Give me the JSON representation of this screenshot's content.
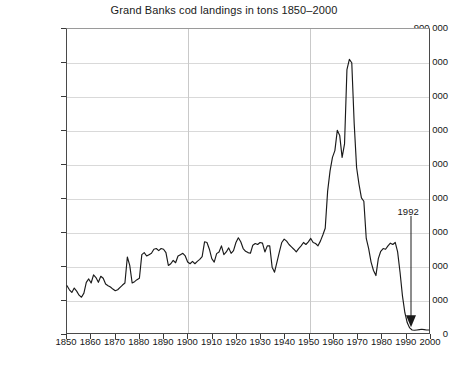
{
  "chart_data": {
    "type": "line",
    "title": "Grand Banks cod landings in tons 1850–2000",
    "xlabel": "",
    "ylabel": "",
    "xlim": [
      1850,
      2000
    ],
    "ylim": [
      0,
      900000
    ],
    "grid": true,
    "legend": "none",
    "y_ticks": [
      0,
      100000,
      200000,
      300000,
      400000,
      500000,
      600000,
      700000,
      800000,
      900000
    ],
    "y_tick_labels": [
      "0",
      "100 000",
      "200 000",
      "300 000",
      "400 000",
      "500 000",
      "600 000",
      "700 000",
      "800 000",
      "900 000"
    ],
    "x_ticks": [
      1850,
      1860,
      1870,
      1880,
      1890,
      1900,
      1910,
      1920,
      1930,
      1940,
      1950,
      1960,
      1970,
      1980,
      1990,
      2000
    ],
    "x_tick_labels": [
      "1850",
      "1860",
      "1870",
      "1880",
      "1890",
      "1900",
      "1910",
      "1920",
      "1930",
      "1940",
      "1950",
      "1960",
      "1970",
      "1980",
      "1990",
      "2000"
    ],
    "x_gridlines": [
      1900,
      1950
    ],
    "series_name": "Grand Banks cod landings",
    "line_color": "#1a1a1a",
    "x": [
      1850,
      1851,
      1852,
      1853,
      1854,
      1855,
      1856,
      1857,
      1858,
      1859,
      1860,
      1861,
      1862,
      1863,
      1864,
      1865,
      1866,
      1867,
      1868,
      1869,
      1870,
      1871,
      1872,
      1873,
      1874,
      1875,
      1876,
      1877,
      1878,
      1879,
      1880,
      1881,
      1882,
      1883,
      1884,
      1885,
      1886,
      1887,
      1888,
      1889,
      1890,
      1891,
      1892,
      1893,
      1894,
      1895,
      1896,
      1897,
      1898,
      1899,
      1900,
      1901,
      1902,
      1903,
      1904,
      1905,
      1906,
      1907,
      1908,
      1909,
      1910,
      1911,
      1912,
      1913,
      1914,
      1915,
      1916,
      1917,
      1918,
      1919,
      1920,
      1921,
      1922,
      1923,
      1924,
      1925,
      1926,
      1927,
      1928,
      1929,
      1930,
      1931,
      1932,
      1933,
      1934,
      1935,
      1936,
      1937,
      1938,
      1939,
      1940,
      1941,
      1942,
      1943,
      1944,
      1945,
      1946,
      1947,
      1948,
      1949,
      1950,
      1951,
      1952,
      1953,
      1954,
      1955,
      1956,
      1957,
      1958,
      1959,
      1960,
      1961,
      1962,
      1963,
      1964,
      1965,
      1966,
      1967,
      1968,
      1969,
      1970,
      1971,
      1972,
      1973,
      1974,
      1975,
      1976,
      1977,
      1978,
      1979,
      1980,
      1981,
      1982,
      1983,
      1984,
      1985,
      1986,
      1987,
      1988,
      1989,
      1990,
      1991,
      1992,
      1993,
      1994,
      1995,
      1996,
      1997,
      1998,
      1999,
      2000
    ],
    "y": [
      140000,
      128000,
      120000,
      133000,
      124000,
      112000,
      106000,
      118000,
      150000,
      160000,
      148000,
      172000,
      164000,
      150000,
      168000,
      162000,
      145000,
      140000,
      136000,
      130000,
      125000,
      128000,
      135000,
      142000,
      148000,
      225000,
      200000,
      148000,
      152000,
      158000,
      162000,
      232000,
      238000,
      228000,
      232000,
      236000,
      248000,
      250000,
      244000,
      250000,
      248000,
      238000,
      200000,
      205000,
      215000,
      208000,
      228000,
      232000,
      236000,
      228000,
      210000,
      205000,
      212000,
      205000,
      212000,
      218000,
      226000,
      270000,
      268000,
      248000,
      220000,
      210000,
      235000,
      240000,
      258000,
      232000,
      240000,
      252000,
      236000,
      244000,
      268000,
      282000,
      270000,
      250000,
      242000,
      238000,
      236000,
      260000,
      265000,
      262000,
      268000,
      266000,
      240000,
      258000,
      258000,
      195000,
      180000,
      210000,
      240000,
      268000,
      278000,
      272000,
      262000,
      255000,
      248000,
      240000,
      250000,
      258000,
      268000,
      262000,
      270000,
      280000,
      268000,
      265000,
      258000,
      272000,
      290000,
      310000,
      420000,
      480000,
      520000,
      540000,
      600000,
      585000,
      520000,
      560000,
      780000,
      810000,
      800000,
      620000,
      490000,
      440000,
      400000,
      390000,
      280000,
      250000,
      210000,
      185000,
      170000,
      220000,
      242000,
      250000,
      248000,
      258000,
      266000,
      262000,
      268000,
      240000,
      180000,
      110000,
      60000,
      30000,
      15000,
      9000,
      8000,
      9000,
      10000,
      11000,
      10000,
      9000,
      9000
    ],
    "annotations": [
      {
        "label": "1992",
        "x": 1992,
        "points_to_y": 20000,
        "arrow": "down"
      }
    ]
  }
}
